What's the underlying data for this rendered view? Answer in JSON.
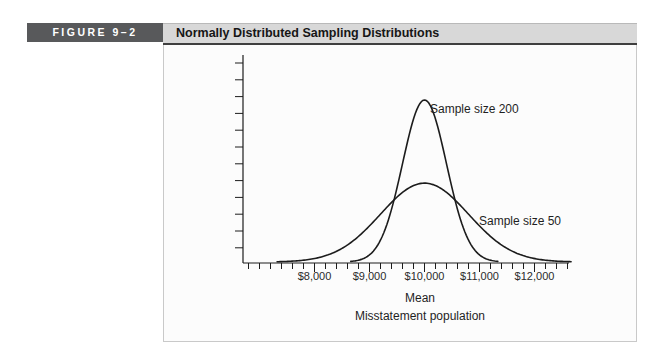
{
  "figure": {
    "label": "FIGURE 9–2",
    "title": "Normally Distributed Sampling Distributions"
  },
  "chart_data": {
    "type": "line",
    "subtype": "normal-distribution-curves",
    "title": "Normally Distributed Sampling Distributions",
    "xlabel_line1": "Mean",
    "xlabel_line2": "Misstatement population",
    "ylabel": "",
    "grid": false,
    "legend": "inline-annotations",
    "mean": 10000,
    "x_tick_labels": [
      "$8,000",
      "$9,000",
      "$10,000",
      "$11,000",
      "$12,000"
    ],
    "x_tick_values": [
      8000,
      9000,
      10000,
      11000,
      12000
    ],
    "x_minor_tick_step": 200,
    "x_minor_tick_range": [
      6800,
      12600
    ],
    "x_axis_range": [
      6700,
      12650
    ],
    "y_minor_tick_count": 12,
    "series": [
      {
        "name": "Sample size 200",
        "mean": 10000,
        "sigma": 400,
        "relative_peak_height": 1.0
      },
      {
        "name": "Sample size 50",
        "mean": 10000,
        "sigma": 800,
        "relative_peak_height": 0.49
      }
    ]
  },
  "colors": {
    "figure_label_bg": "#58595b",
    "figure_label_text": "#ffffff",
    "title_bar_bg": "#d8d8d8",
    "title_bar_border": "#3f3f3f",
    "panel_bg": "#fcfcfc",
    "panel_border": "#c9c9c9",
    "curve": "#1c1c1c",
    "axis": "#1c1c1c",
    "text": "#262626"
  }
}
